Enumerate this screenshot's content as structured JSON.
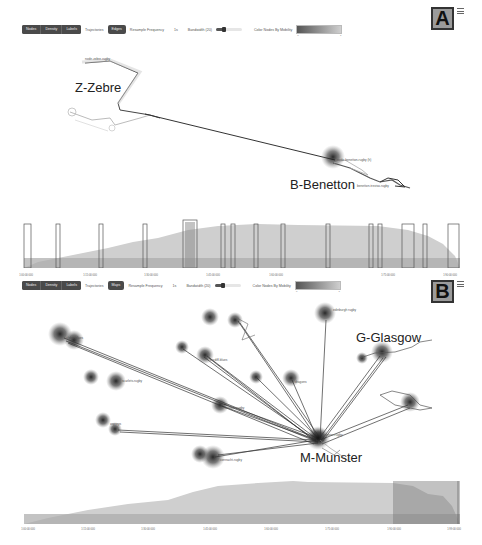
{
  "panels": [
    {
      "id": "A",
      "badge": "A",
      "toolbar": {
        "group_buttons": [
          "Nodes",
          "Density",
          "Labels"
        ],
        "trajectories_label": "Trajectories",
        "mode_button": "Edges",
        "resample_label": "Resample Frequency",
        "resample_value": "1s",
        "bandwidth_label": "Bandwidth (20)",
        "color_label": "Color Nodes By Mobility",
        "gradient_min": "0",
        "gradient_max": "1"
      },
      "region_labels": [
        "Z-Zebre",
        "B-Benetton"
      ],
      "node_labels": [
        "node-zebre-rugby",
        "node-benetton-rugby (h)",
        "benetton-treviso-rugby"
      ],
      "timeline": {
        "ticks": [
          "1:00:00:000",
          "1:15:00:000",
          "1:30:00:000",
          "1:45:00:000",
          "1:60:00:000",
          "1:75:00:000",
          "1:90:00:000"
        ]
      }
    },
    {
      "id": "B",
      "badge": "B",
      "toolbar": {
        "group_buttons": [
          "Nodes",
          "Density",
          "Labels"
        ],
        "trajectories_label": "Trajectories",
        "mode_button": "Maps",
        "resample_label": "Resample Frequency",
        "resample_value": "1s",
        "bandwidth_label": "Bandwidth (20)",
        "color_label": "Color Nodes By Mobility",
        "gradient_min": "0",
        "gradient_max": "1"
      },
      "region_labels": [
        "G-Glasgow",
        "M-Munster"
      ],
      "node_labels": [
        "edinburgh rugby",
        "ulster_blues",
        "scarlets-rugby",
        "dragons",
        "cardiff-blues",
        "ospreys",
        "leinster-rugby",
        "connacht-rugby",
        "munster-rugby"
      ],
      "timeline": {
        "ticks": [
          "1:00:00:000",
          "1:15:00:000",
          "1:30:00:000",
          "1:45:00:000",
          "1:60:00:000",
          "1:75:00:000",
          "1:90:00:000",
          "1:99:00:000"
        ]
      }
    }
  ]
}
